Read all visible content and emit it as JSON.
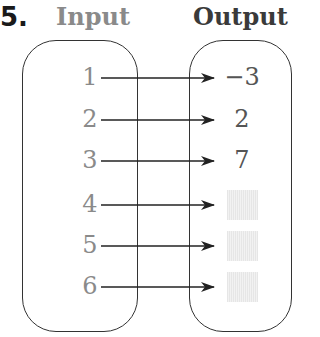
{
  "problem": {
    "number": "5.",
    "headers": {
      "input": "Input",
      "output": "Output"
    }
  },
  "mapping": {
    "inputs": [
      "1",
      "2",
      "3",
      "4",
      "5",
      "6"
    ],
    "outputs": [
      "−3",
      "2",
      "7",
      "",
      "",
      ""
    ],
    "output_blank": [
      false,
      false,
      false,
      true,
      true,
      true
    ],
    "row_y": [
      78,
      120,
      161,
      205,
      246,
      287
    ]
  },
  "colors": {
    "input_text": "#8a8a8a",
    "output_text": "#555555",
    "border": "#333333",
    "placeholder": "#e6e6e6"
  }
}
